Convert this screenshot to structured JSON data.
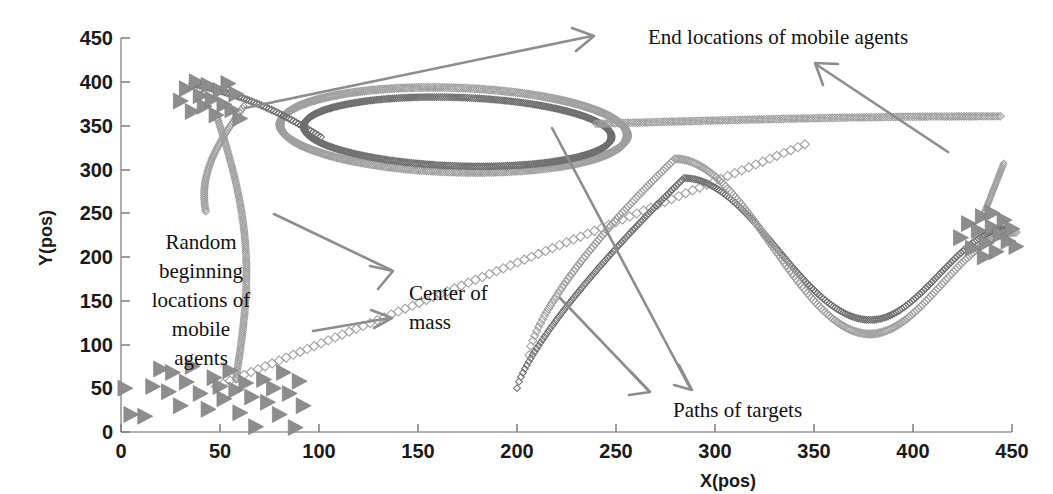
{
  "figure": {
    "type": "scatter-trajectory-plot",
    "background_color": "#ffffff",
    "marker_color": "#8d8d8d",
    "path_color": "#9f9f9f",
    "axis_color": "#9a9a9a"
  },
  "axes": {
    "x": {
      "label": "X(pos)",
      "ticks": [
        "0",
        "50",
        "100",
        "150",
        "200",
        "250",
        "300",
        "350",
        "400",
        "450"
      ],
      "range": [
        0,
        460
      ]
    },
    "y": {
      "label": "Y(pos)",
      "ticks": [
        "0",
        "50",
        "100",
        "150",
        "200",
        "250",
        "300",
        "350",
        "400",
        "450"
      ],
      "range": [
        0,
        460
      ]
    }
  },
  "annotations": [
    {
      "id": "end-locations",
      "text": "End locations of mobile agents",
      "lines": [
        "End locations of mobile agents"
      ]
    },
    {
      "id": "random-beginning",
      "text": "Random beginning locations of mobile agents",
      "lines": [
        "Random",
        "beginning",
        "locations of",
        "mobile",
        "agents"
      ]
    },
    {
      "id": "center-of-mass",
      "text": "Center of mass",
      "lines": [
        "Center of",
        "mass"
      ]
    },
    {
      "id": "paths-of-targets",
      "text": "Paths of targets",
      "lines": [
        "Paths of targets"
      ]
    }
  ],
  "chart_data": {
    "type": "scatter",
    "title": "",
    "xlabel": "X(pos)",
    "ylabel": "Y(pos)",
    "xlim": [
      0,
      460
    ],
    "ylim": [
      0,
      460
    ],
    "grid": false,
    "legend": "none",
    "series": [
      {
        "name": "Random beginning locations of mobile agents",
        "marker": "right-triangle",
        "color": "#8d8d8d",
        "points": [
          [
            2,
            50
          ],
          [
            5,
            20
          ],
          [
            12,
            18
          ],
          [
            16,
            52
          ],
          [
            20,
            72
          ],
          [
            24,
            46
          ],
          [
            26,
            68
          ],
          [
            30,
            30
          ],
          [
            33,
            57
          ],
          [
            36,
            75
          ],
          [
            40,
            44
          ],
          [
            44,
            26
          ],
          [
            47,
            62
          ],
          [
            50,
            52
          ],
          [
            52,
            38
          ],
          [
            55,
            70
          ],
          [
            58,
            48
          ],
          [
            60,
            22
          ],
          [
            63,
            56
          ],
          [
            66,
            40
          ],
          [
            68,
            6
          ],
          [
            72,
            60
          ],
          [
            74,
            34
          ],
          [
            77,
            50
          ],
          [
            80,
            20
          ],
          [
            82,
            68
          ],
          [
            85,
            44
          ],
          [
            88,
            5
          ],
          [
            90,
            58
          ],
          [
            92,
            30
          ]
        ]
      },
      {
        "name": "End locations of mobile agents (upper-left cluster)",
        "marker": "right-triangle",
        "color": "#8d8d8d",
        "points": [
          [
            30,
            378
          ],
          [
            33,
            392
          ],
          [
            36,
            366
          ],
          [
            38,
            400
          ],
          [
            40,
            384
          ],
          [
            42,
            372
          ],
          [
            44,
            396
          ],
          [
            46,
            380
          ],
          [
            48,
            362
          ],
          [
            50,
            390
          ],
          [
            52,
            374
          ],
          [
            54,
            398
          ],
          [
            56,
            368
          ],
          [
            58,
            386
          ],
          [
            60,
            358
          ]
        ]
      },
      {
        "name": "End locations of mobile agents (right cluster)",
        "marker": "right-triangle",
        "color": "#8d8d8d",
        "points": [
          [
            424,
            222
          ],
          [
            428,
            238
          ],
          [
            430,
            210
          ],
          [
            433,
            230
          ],
          [
            435,
            246
          ],
          [
            437,
            216
          ],
          [
            440,
            234
          ],
          [
            442,
            206
          ],
          [
            444,
            226
          ],
          [
            446,
            242
          ],
          [
            448,
            218
          ],
          [
            450,
            232
          ],
          [
            452,
            212
          ],
          [
            440,
            250
          ],
          [
            436,
            200
          ]
        ]
      },
      {
        "name": "Path of target 1",
        "marker": "diamond",
        "color": "#6f6f6f",
        "comment": "loop path: enters upper-left, large counter-clockwise loop, exits right"
      },
      {
        "name": "Path of target 2",
        "marker": "diamond",
        "color": "#9f9f9f",
        "comment": "second loop path parallel to target 1"
      },
      {
        "name": "Center of mass trajectory",
        "marker": "diamond",
        "color": "#9f9f9f",
        "comment": "rising diagonal from lower-left to upper-right"
      },
      {
        "name": "Right S-curve path (target)",
        "marker": "diamond",
        "color": "#6f6f6f",
        "comment": "S-shaped path peaking near x=280,y=290 then trough near x=380,y=130"
      },
      {
        "name": "Right S-curve path (agents)",
        "marker": "diamond",
        "color": "#9f9f9f",
        "comment": "parallel outer S-shaped path"
      }
    ]
  }
}
